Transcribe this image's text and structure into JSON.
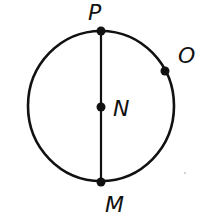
{
  "diagram": {
    "type": "circle-with-diameter",
    "colors": {
      "stroke": "#111111",
      "background": "#ffffff"
    },
    "circle": {
      "cx": 101,
      "cy": 106,
      "rx": 73,
      "ry": 75
    },
    "diameter": {
      "from": "P",
      "to": "M"
    },
    "points": [
      {
        "id": "P",
        "label": "P",
        "x": 101,
        "y": 31,
        "label_x": 88,
        "label_y": 20
      },
      {
        "id": "O",
        "label": "O",
        "x": 165,
        "y": 71,
        "label_x": 178,
        "label_y": 63
      },
      {
        "id": "N",
        "label": "N",
        "x": 101,
        "y": 107,
        "label_x": 113,
        "label_y": 116
      },
      {
        "id": "M",
        "label": "M",
        "x": 101,
        "y": 182,
        "label_x": 105,
        "label_y": 212
      }
    ]
  }
}
